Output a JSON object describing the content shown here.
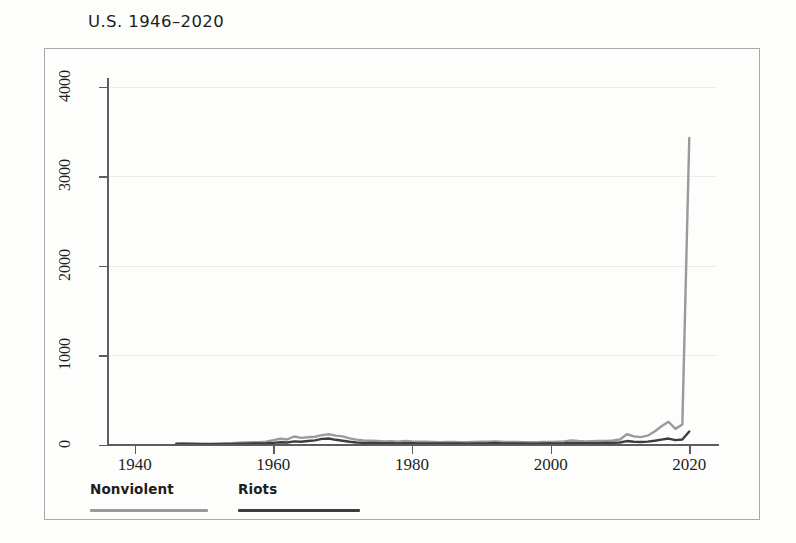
{
  "chart_data": {
    "type": "line",
    "title": "U.S. 1946–2020",
    "xlabel": "",
    "ylabel": "",
    "xlim": [
      1936,
      2024
    ],
    "ylim": [
      0,
      4300
    ],
    "xticks": [
      1940,
      1960,
      1980,
      2000,
      2020
    ],
    "yticks": [
      0,
      1000,
      2000,
      3000,
      4000
    ],
    "xtick_labels": [
      "1940",
      "1960",
      "1980",
      "2000",
      "2020"
    ],
    "ytick_labels": [
      "0",
      "1000",
      "2000",
      "3000",
      "4000"
    ],
    "grid": "horizontal-faint",
    "legend_position": "below-left",
    "x": [
      1946,
      1947,
      1948,
      1949,
      1950,
      1951,
      1952,
      1953,
      1954,
      1955,
      1956,
      1957,
      1958,
      1959,
      1960,
      1961,
      1962,
      1963,
      1964,
      1965,
      1966,
      1967,
      1968,
      1969,
      1970,
      1971,
      1972,
      1973,
      1974,
      1975,
      1976,
      1977,
      1978,
      1979,
      1980,
      1981,
      1982,
      1983,
      1984,
      1985,
      1986,
      1987,
      1988,
      1989,
      1990,
      1991,
      1992,
      1993,
      1994,
      1995,
      1996,
      1997,
      1998,
      1999,
      2000,
      2001,
      2002,
      2003,
      2004,
      2005,
      2006,
      2007,
      2008,
      2009,
      2010,
      2011,
      2012,
      2013,
      2014,
      2015,
      2016,
      2017,
      2018,
      2019,
      2020
    ],
    "series": [
      {
        "name": "Nonviolent",
        "color": "#9a9a9a",
        "values": [
          18,
          20,
          17,
          16,
          15,
          14,
          16,
          18,
          20,
          26,
          28,
          30,
          32,
          38,
          55,
          70,
          62,
          95,
          80,
          86,
          92,
          110,
          120,
          105,
          96,
          74,
          60,
          52,
          48,
          44,
          40,
          42,
          38,
          44,
          40,
          38,
          36,
          34,
          32,
          34,
          33,
          32,
          30,
          34,
          36,
          38,
          40,
          36,
          34,
          33,
          32,
          31,
          30,
          34,
          33,
          36,
          40,
          52,
          44,
          40,
          42,
          44,
          46,
          50,
          62,
          120,
          96,
          88,
          104,
          150,
          210,
          260,
          180,
          230,
          3430
        ]
      },
      {
        "name": "Riots",
        "color": "#3d3d3d",
        "values": [
          12,
          13,
          11,
          10,
          10,
          9,
          10,
          11,
          12,
          14,
          15,
          16,
          17,
          19,
          24,
          30,
          28,
          40,
          36,
          44,
          52,
          68,
          72,
          58,
          48,
          36,
          28,
          24,
          22,
          20,
          19,
          20,
          18,
          20,
          19,
          18,
          17,
          16,
          16,
          17,
          16,
          16,
          15,
          17,
          18,
          19,
          22,
          18,
          17,
          16,
          16,
          15,
          15,
          17,
          16,
          18,
          20,
          24,
          21,
          19,
          20,
          21,
          22,
          24,
          28,
          44,
          36,
          34,
          38,
          48,
          60,
          72,
          54,
          62,
          150
        ]
      }
    ]
  },
  "legend": {
    "items": [
      {
        "label": "Nonviolent",
        "color": "#9a9a9a"
      },
      {
        "label": "Riots",
        "color": "#3d3d3d"
      }
    ]
  }
}
